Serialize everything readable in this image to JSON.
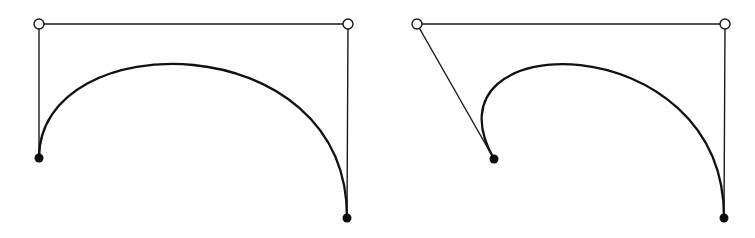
{
  "figure": {
    "colors": {
      "background": "#ffffff",
      "line": "#1a1a1a",
      "curve": "#111111",
      "endpoint_fill": "#0d0d0d",
      "control_point_fill": "#ffffff"
    },
    "panels": [
      {
        "id": "left",
        "endpoints": [
          {
            "x": 39,
            "y": 158
          },
          {
            "x": 347,
            "y": 218
          }
        ],
        "control_points": [
          {
            "x": 39,
            "y": 24
          },
          {
            "x": 348,
            "y": 24
          }
        ],
        "control_polygon": [
          {
            "x": 39,
            "y": 158
          },
          {
            "x": 39,
            "y": 24
          },
          {
            "x": 348,
            "y": 24
          },
          {
            "x": 347,
            "y": 218
          }
        ]
      },
      {
        "id": "right",
        "endpoints": [
          {
            "x": 494,
            "y": 159
          },
          {
            "x": 724,
            "y": 218
          }
        ],
        "control_points": [
          {
            "x": 417,
            "y": 24
          },
          {
            "x": 725,
            "y": 24
          }
        ],
        "control_polygon": [
          {
            "x": 494,
            "y": 159
          },
          {
            "x": 417,
            "y": 24
          },
          {
            "x": 725,
            "y": 24
          },
          {
            "x": 724,
            "y": 218
          }
        ]
      }
    ]
  }
}
